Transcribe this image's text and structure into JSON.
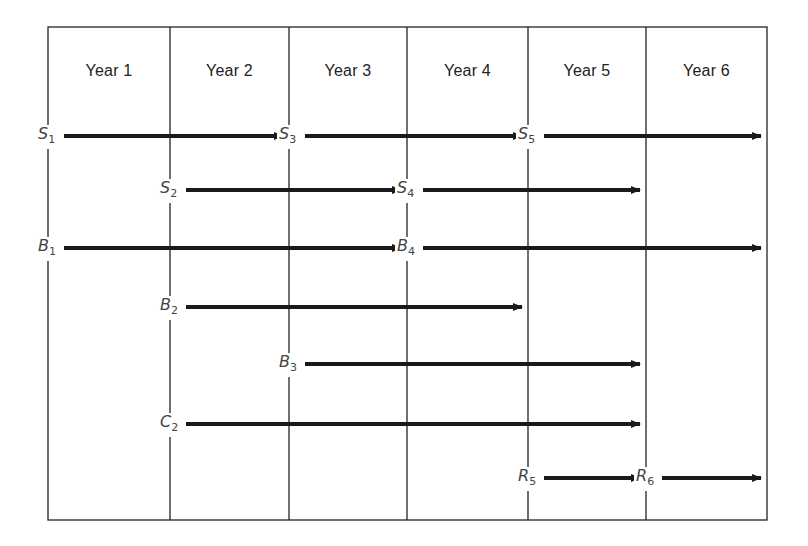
{
  "diagram": {
    "type": "timeline",
    "columns": [
      "Year 1",
      "Year 2",
      "Year 3",
      "Year 4",
      "Year 5",
      "Year 6"
    ],
    "arrows": [
      {
        "label": "S",
        "sub": "1",
        "start_year": 1,
        "end_year": 3,
        "row": 0
      },
      {
        "label": "S",
        "sub": "3",
        "start_year": 3,
        "end_year": 5,
        "row": 0
      },
      {
        "label": "S",
        "sub": "5",
        "start_year": 5,
        "end_year": 7,
        "row": 0
      },
      {
        "label": "S",
        "sub": "2",
        "start_year": 2,
        "end_year": 4,
        "row": 1
      },
      {
        "label": "S",
        "sub": "4",
        "start_year": 4,
        "end_year": 6,
        "row": 1
      },
      {
        "label": "B",
        "sub": "1",
        "start_year": 1,
        "end_year": 4,
        "row": 2
      },
      {
        "label": "B",
        "sub": "4",
        "start_year": 4,
        "end_year": 7,
        "row": 2
      },
      {
        "label": "B",
        "sub": "2",
        "start_year": 2,
        "end_year": 5,
        "row": 3
      },
      {
        "label": "B",
        "sub": "3",
        "start_year": 3,
        "end_year": 6,
        "row": 4
      },
      {
        "label": "C",
        "sub": "2",
        "start_year": 2,
        "end_year": 6,
        "row": 5
      },
      {
        "label": "R",
        "sub": "5",
        "start_year": 5,
        "end_year": 6,
        "row": 6
      },
      {
        "label": "R",
        "sub": "6",
        "start_year": 6,
        "end_year": 7,
        "row": 6
      }
    ]
  }
}
